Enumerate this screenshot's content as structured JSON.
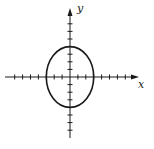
{
  "figure": {
    "type": "ellipse-on-axes",
    "x_label": "x",
    "y_label": "y",
    "ellipse": {
      "center": [
        0,
        0
      ],
      "semi_axis_x": 3,
      "semi_axis_y": 4
    },
    "x_ticks": [
      -7,
      -6,
      -5,
      -4,
      -3,
      -2,
      -1,
      1,
      2,
      3,
      4,
      5,
      6,
      7
    ],
    "y_ticks": [
      -7,
      -6,
      -5,
      -4,
      -3,
      -2,
      -1,
      1,
      2,
      3,
      4,
      5,
      6,
      7
    ],
    "colors": {
      "stroke": "#1a1a1a",
      "background": "#ffffff"
    }
  }
}
